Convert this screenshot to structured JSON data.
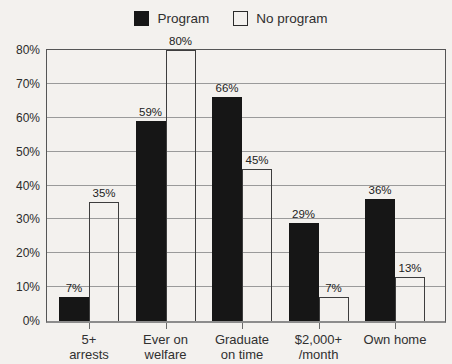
{
  "legend": {
    "items": [
      {
        "label": "Program",
        "swatch": "black-filled-square-icon"
      },
      {
        "label": "No program",
        "swatch": "white-outline-square-icon"
      }
    ]
  },
  "chart_data": {
    "type": "bar",
    "title": "",
    "categories": [
      "5+\narrests",
      "Ever on\nwelfare",
      "Graduate\non time",
      "$2,000+\n/month",
      "Own home"
    ],
    "series": [
      {
        "name": "Program",
        "style": "solid",
        "color": "#161616",
        "values": [
          7,
          59,
          66,
          29,
          36
        ],
        "value_labels": [
          "7%",
          "59%",
          "66%",
          "29%",
          "36%"
        ]
      },
      {
        "name": "No program",
        "style": "outline",
        "color": "#f3f1ee",
        "values": [
          35,
          80,
          45,
          7,
          13
        ],
        "value_labels": [
          "35%",
          "80%",
          "45%",
          "7%",
          "13%"
        ]
      }
    ],
    "xlabel": "",
    "ylabel": "",
    "ylim": [
      0,
      80
    ],
    "y_ticks": [
      0,
      10,
      20,
      30,
      40,
      50,
      60,
      70,
      80
    ],
    "y_tick_labels": [
      "0%",
      "10%",
      "20%",
      "30%",
      "40%",
      "50%",
      "60%",
      "70%",
      "80%"
    ],
    "grid": true,
    "legend_position": "top-center"
  },
  "colors": {
    "background": "#f3f1ee",
    "bar_solid": "#161616",
    "bar_outline_stroke": "#3d3d3d",
    "gridline": "#9a9a9a",
    "text": "#2b2b2b"
  }
}
